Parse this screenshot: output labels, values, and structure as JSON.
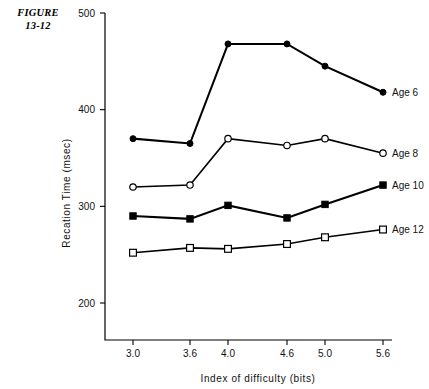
{
  "figure": {
    "label_line1": "FIGURE",
    "label_line2": "13-12"
  },
  "chart_data": {
    "type": "line",
    "title": "",
    "xlabel": "Index of difficulty (bits)",
    "ylabel": "Recation Time (msec)",
    "categories": [
      "3.0",
      "3.6",
      "4.0",
      "4.6",
      "5.0",
      "5.6"
    ],
    "x": [
      3.0,
      3.6,
      4.0,
      4.6,
      5.0,
      5.6
    ],
    "xtick_labels": [
      "3.0",
      "3.6",
      "4.0",
      "4.6",
      "5.0",
      "5.6"
    ],
    "ytick_labels": [
      "500",
      "400",
      "300",
      "200"
    ],
    "yticks": [
      500,
      400,
      300,
      200
    ],
    "ylim": [
      160,
      500
    ],
    "grid": false,
    "legend_position": "right-inline",
    "series": [
      {
        "name": "Age  6",
        "marker": "filled-circle",
        "values": [
          370,
          365,
          468,
          468,
          445,
          418
        ]
      },
      {
        "name": "Age  8",
        "marker": "open-circle",
        "values": [
          320,
          322,
          370,
          363,
          370,
          355
        ]
      },
      {
        "name": "Age 10",
        "marker": "filled-square",
        "values": [
          290,
          287,
          301,
          288,
          302,
          322
        ]
      },
      {
        "name": "Age 12",
        "marker": "open-square",
        "values": [
          252,
          257,
          256,
          261,
          268,
          276
        ]
      }
    ]
  }
}
